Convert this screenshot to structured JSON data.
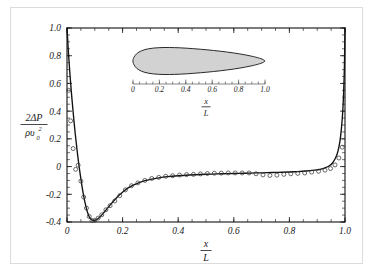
{
  "figure": {
    "background_color": "#ffffff",
    "border_color": "#dcdcdc"
  },
  "chart_data": {
    "type": "line",
    "title": "",
    "subtitle": "",
    "xlabel_numerator": "x",
    "xlabel_denominator": "L",
    "ylabel_numerator": "2ΔP",
    "ylabel_denominator": "ρυ",
    "ylabel_denominator_sup": "2",
    "ylabel_denominator_sub": "0",
    "xlim": [
      0,
      1.0
    ],
    "ylim": [
      -0.4,
      1.0
    ],
    "grid": false,
    "legend": false,
    "xticks": [
      0,
      0.2,
      0.4,
      0.6,
      0.8,
      1.0
    ],
    "xtick_labels": [
      "0",
      "0.2",
      "0.4",
      "0.6",
      "0.8",
      "1.0"
    ],
    "yticks": [
      -0.4,
      -0.2,
      0,
      0.2,
      0.4,
      0.6,
      0.8,
      1.0
    ],
    "ytick_labels": [
      "-0.4",
      "-0.2",
      "0",
      "0.2",
      "0.4",
      "0.6",
      "0.8",
      "1.0"
    ],
    "xminor_step": 0.05,
    "yminor_step": 0.05,
    "series": [
      {
        "name": "theory",
        "style": "solid-line",
        "color": "#111111",
        "x": [
          0.0,
          0.002,
          0.005,
          0.008,
          0.012,
          0.016,
          0.02,
          0.025,
          0.03,
          0.035,
          0.04,
          0.045,
          0.05,
          0.055,
          0.06,
          0.065,
          0.07,
          0.075,
          0.08,
          0.085,
          0.09,
          0.095,
          0.1,
          0.11,
          0.12,
          0.13,
          0.14,
          0.15,
          0.16,
          0.175,
          0.19,
          0.205,
          0.22,
          0.24,
          0.26,
          0.28,
          0.3,
          0.33,
          0.36,
          0.4,
          0.44,
          0.48,
          0.52,
          0.56,
          0.6,
          0.64,
          0.68,
          0.72,
          0.76,
          0.8,
          0.83,
          0.86,
          0.89,
          0.91,
          0.93,
          0.945,
          0.955,
          0.965,
          0.972,
          0.978,
          0.983,
          0.987,
          0.991,
          0.994,
          0.996,
          0.998,
          0.999,
          1.0
        ],
        "y": [
          1.0,
          0.93,
          0.83,
          0.74,
          0.63,
          0.53,
          0.44,
          0.33,
          0.23,
          0.14,
          0.055,
          -0.02,
          -0.09,
          -0.155,
          -0.212,
          -0.262,
          -0.303,
          -0.337,
          -0.362,
          -0.378,
          -0.387,
          -0.39,
          -0.389,
          -0.378,
          -0.36,
          -0.338,
          -0.314,
          -0.29,
          -0.266,
          -0.232,
          -0.202,
          -0.176,
          -0.154,
          -0.132,
          -0.115,
          -0.102,
          -0.092,
          -0.081,
          -0.073,
          -0.066,
          -0.061,
          -0.057,
          -0.054,
          -0.052,
          -0.05,
          -0.048,
          -0.046,
          -0.044,
          -0.042,
          -0.039,
          -0.036,
          -0.032,
          -0.026,
          -0.02,
          -0.008,
          0.008,
          0.026,
          0.058,
          0.092,
          0.14,
          0.2,
          0.272,
          0.37,
          0.48,
          0.59,
          0.73,
          0.86,
          1.0
        ]
      },
      {
        "name": "experiment",
        "style": "open-circles",
        "color": "#3a3a3a",
        "x": [
          0.006,
          0.013,
          0.022,
          0.031,
          0.04,
          0.05,
          0.06,
          0.07,
          0.08,
          0.09,
          0.1,
          0.112,
          0.125,
          0.14,
          0.155,
          0.172,
          0.19,
          0.21,
          0.232,
          0.255,
          0.28,
          0.305,
          0.33,
          0.355,
          0.38,
          0.405,
          0.43,
          0.455,
          0.48,
          0.505,
          0.53,
          0.555,
          0.58,
          0.605,
          0.63,
          0.655,
          0.68,
          0.705,
          0.73,
          0.755,
          0.78,
          0.805,
          0.83,
          0.855,
          0.88,
          0.905,
          0.928,
          0.948,
          0.964,
          0.978,
          0.99
        ],
        "y": [
          0.55,
          0.33,
          0.13,
          -0.02,
          0.01,
          -0.105,
          -0.22,
          -0.3,
          -0.36,
          -0.39,
          -0.388,
          -0.372,
          -0.348,
          -0.312,
          -0.282,
          -0.248,
          -0.21,
          -0.168,
          -0.138,
          -0.118,
          -0.1,
          -0.086,
          -0.078,
          -0.07,
          -0.066,
          -0.061,
          -0.058,
          -0.056,
          -0.053,
          -0.05,
          -0.048,
          -0.047,
          -0.046,
          -0.046,
          -0.046,
          -0.046,
          -0.052,
          -0.06,
          -0.064,
          -0.062,
          -0.056,
          -0.052,
          -0.049,
          -0.046,
          -0.04,
          -0.034,
          -0.026,
          -0.014,
          0.012,
          0.062,
          0.14
        ]
      }
    ]
  },
  "inset": {
    "name": "body-profile-inset",
    "xlabel_numerator": "x",
    "xlabel_denominator": "L",
    "xlim": [
      0,
      1.0
    ],
    "xticks": [
      0,
      0.2,
      0.4,
      0.6,
      0.8,
      1.0
    ],
    "xtick_labels": [
      "0",
      "0.2",
      "0.4",
      "0.6",
      "0.8",
      "1.0"
    ],
    "xminor_step": 0.05,
    "body_fill_color": "#d2d2d2",
    "body_stroke_color": "#2a2a2a",
    "body_upper": {
      "x": [
        0.0,
        0.006,
        0.015,
        0.028,
        0.045,
        0.065,
        0.09,
        0.12,
        0.155,
        0.195,
        0.235,
        0.275,
        0.315,
        0.36,
        0.41,
        0.46,
        0.51,
        0.56,
        0.61,
        0.66,
        0.71,
        0.76,
        0.81,
        0.855,
        0.895,
        0.93,
        0.958,
        0.978,
        0.991,
        1.0
      ],
      "y": [
        0.05,
        0.125,
        0.2,
        0.27,
        0.33,
        0.38,
        0.422,
        0.455,
        0.478,
        0.493,
        0.5,
        0.5,
        0.496,
        0.487,
        0.473,
        0.456,
        0.436,
        0.414,
        0.39,
        0.363,
        0.333,
        0.3,
        0.262,
        0.222,
        0.182,
        0.142,
        0.104,
        0.07,
        0.038,
        0.006
      ]
    },
    "body_lower": {
      "x": [
        0.0,
        0.006,
        0.015,
        0.028,
        0.045,
        0.065,
        0.09,
        0.12,
        0.155,
        0.195,
        0.235,
        0.275,
        0.315,
        0.36,
        0.41,
        0.46,
        0.51,
        0.56,
        0.61,
        0.66,
        0.71,
        0.76,
        0.81,
        0.855,
        0.895,
        0.93,
        0.958,
        0.978,
        0.991,
        1.0
      ],
      "y": [
        -0.05,
        -0.125,
        -0.2,
        -0.27,
        -0.33,
        -0.38,
        -0.422,
        -0.455,
        -0.478,
        -0.493,
        -0.5,
        -0.5,
        -0.496,
        -0.487,
        -0.473,
        -0.456,
        -0.436,
        -0.414,
        -0.39,
        -0.363,
        -0.333,
        -0.3,
        -0.262,
        -0.222,
        -0.182,
        -0.142,
        -0.104,
        -0.07,
        -0.038,
        -0.006
      ]
    }
  }
}
